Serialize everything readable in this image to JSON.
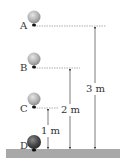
{
  "diagram": {
    "points": [
      {
        "label": "A",
        "height": "3 m"
      },
      {
        "label": "B",
        "height": "2 m"
      },
      {
        "label": "C",
        "height": "1 m"
      },
      {
        "label": "D",
        "height": "0 m"
      }
    ],
    "dimensions": [
      {
        "label": "3 m"
      },
      {
        "label": "2 m"
      },
      {
        "label": "1 m"
      }
    ]
  }
}
